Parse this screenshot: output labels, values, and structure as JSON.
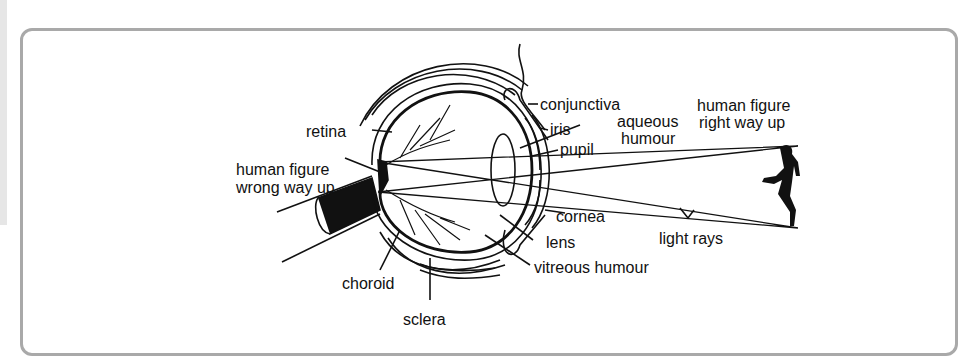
{
  "figure": {
    "labels": {
      "retina": "retina",
      "human_figure_wrong_1": "human figure",
      "human_figure_wrong_2": "wrong way up",
      "choroid": "choroid",
      "sclera": "sclera",
      "conjunctiva": "conjunctiva",
      "iris": "iris",
      "aqueous_1": "aqueous",
      "aqueous_2": "humour",
      "pupil": "pupil",
      "cornea": "cornea",
      "lens": "lens",
      "vitreous": "vitreous humour",
      "human_figure_right_1": "human figure",
      "human_figure_right_2": "right way up",
      "light_rays": "light rays"
    }
  },
  "colors": {
    "frame_border": "#a9a9a9",
    "ink": "#111111",
    "side_strip": "#e6e6e6"
  }
}
